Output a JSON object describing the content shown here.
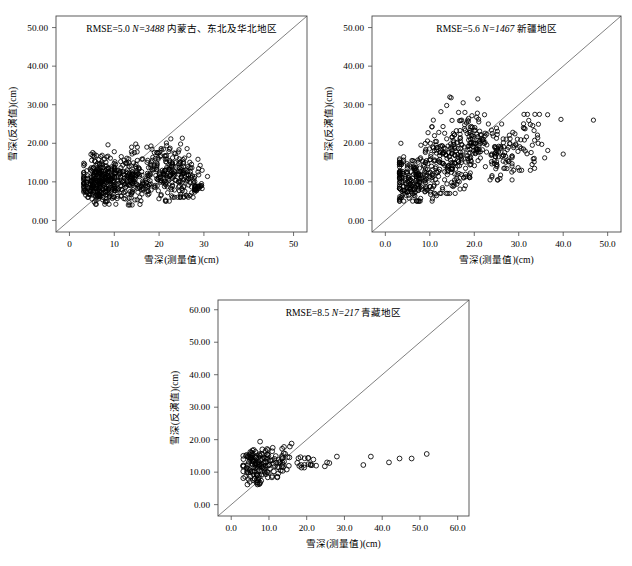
{
  "figure": {
    "type": "scatter-figure",
    "panel_count": 3,
    "background_color": "#ffffff",
    "marker_color": "#000000",
    "line_color": "#555555"
  },
  "chart_data": [
    {
      "type": "scatter",
      "panel_id": "panel-northeast",
      "title": "RMSE=5.0  N=3488  内蒙古、东北及华北地区",
      "rmse_label": "RMSE=5.0",
      "rmse": 5.0,
      "n_label": "N=3488",
      "n": 3488,
      "region": "内蒙古、东北及华北地区",
      "xlabel": "雪深(测量值)(cm)",
      "ylabel": "雪深(反演值)(cm)",
      "xlim": [
        -3,
        53
      ],
      "ylim": [
        -3,
        53
      ],
      "xticks": [
        0,
        10,
        20,
        30,
        40,
        50
      ],
      "xtick_labels": [
        "0",
        "10",
        "20",
        "30",
        "40",
        "50"
      ],
      "yticks": [
        0,
        10,
        20,
        30,
        40,
        50
      ],
      "ytick_labels": [
        "0.00",
        "10.00",
        "20.00",
        "30.00",
        "40.00",
        "50.00"
      ],
      "grid": false,
      "legend": "none",
      "reference_line": {
        "label": "1:1 line",
        "from": [
          -3,
          -3
        ],
        "to": [
          53,
          53
        ]
      },
      "annotations": [],
      "n_drawn": 760,
      "seed": 1471,
      "clusters": [
        {
          "weight": 0.44,
          "x_mean": 7.0,
          "x_sd": 2.4,
          "y_mean": 10.0,
          "y_sd": 2.9,
          "x_min": 3.2,
          "x_max": 13.5,
          "y_min": 4.2,
          "y_max": 18.5
        },
        {
          "weight": 0.22,
          "x_mean": 14.0,
          "x_sd": 2.6,
          "y_mean": 10.8,
          "y_sd": 3.2,
          "x_min": 10.0,
          "x_max": 19.5,
          "y_min": 4.0,
          "y_max": 19.0
        },
        {
          "weight": 0.2,
          "x_mean": 21.5,
          "x_sd": 2.0,
          "y_mean": 13.0,
          "y_sd": 4.0,
          "x_min": 17.5,
          "x_max": 25.5,
          "y_min": 5.0,
          "y_max": 21.8
        },
        {
          "weight": 0.11,
          "x_mean": 26.0,
          "x_sd": 1.6,
          "y_mean": 12.0,
          "y_sd": 3.4,
          "x_min": 23.0,
          "x_max": 29.5,
          "y_min": 6.0,
          "y_max": 19.0
        },
        {
          "weight": 0.03,
          "x_mean": 28.3,
          "x_sd": 0.7,
          "y_mean": 8.6,
          "y_sd": 0.9,
          "x_min": 27.2,
          "x_max": 29.6,
          "y_min": 7.2,
          "y_max": 10.2
        }
      ],
      "outliers": [
        [
          30.8,
          11.4
        ],
        [
          24.8,
          19.8
        ],
        [
          14.8,
          19.8
        ],
        [
          8.6,
          19.6
        ],
        [
          5.2,
          17.6
        ],
        [
          18.2,
          19.3
        ],
        [
          29.6,
          13.0
        ]
      ]
    },
    {
      "type": "scatter",
      "panel_id": "panel-xinjiang",
      "title": "RMSE=5.6  N=1467  新疆地区",
      "rmse_label": "RMSE=5.6",
      "rmse": 5.6,
      "n_label": "N=1467",
      "n": 1467,
      "region": "新疆地区",
      "xlabel": "雪深(测量值)(cm)",
      "ylabel": "雪深(反演值)(cm)",
      "xlim": [
        -3,
        53
      ],
      "ylim": [
        -3,
        53
      ],
      "xticks": [
        0,
        10,
        20,
        30,
        40,
        50
      ],
      "xtick_labels": [
        "0.0",
        "10.0",
        "20.0",
        "30.0",
        "40.0",
        "50.0"
      ],
      "yticks": [
        0,
        10,
        20,
        30,
        40,
        50
      ],
      "ytick_labels": [
        "0.00",
        "10.00",
        "20.00",
        "30.00",
        "40.00",
        "50.00"
      ],
      "grid": false,
      "legend": "none",
      "reference_line": {
        "label": "1:1 line",
        "from": [
          -3,
          -3
        ],
        "to": [
          53,
          53
        ]
      },
      "annotations": [],
      "n_drawn": 620,
      "seed": 9283,
      "clusters": [
        {
          "weight": 0.34,
          "x_mean": 6.2,
          "x_sd": 2.2,
          "y_mean": 10.5,
          "y_sd": 3.0,
          "x_min": 3.2,
          "x_max": 11.5,
          "y_min": 5.0,
          "y_max": 16.5
        },
        {
          "weight": 0.26,
          "x_mean": 13.5,
          "x_sd": 2.8,
          "y_mean": 15.5,
          "y_sd": 4.2,
          "x_min": 9.0,
          "x_max": 19.0,
          "y_min": 7.0,
          "y_max": 26.0
        },
        {
          "weight": 0.22,
          "x_mean": 19.5,
          "x_sd": 2.6,
          "y_mean": 19.5,
          "y_sd": 4.5,
          "x_min": 15.0,
          "x_max": 25.0,
          "y_min": 9.0,
          "y_max": 28.0
        },
        {
          "weight": 0.1,
          "x_mean": 25.5,
          "x_sd": 1.8,
          "y_mean": 16.5,
          "y_sd": 4.0,
          "x_min": 22.5,
          "x_max": 28.5,
          "y_min": 10.5,
          "y_max": 25.0
        },
        {
          "weight": 0.08,
          "x_mean": 32.0,
          "x_sd": 2.4,
          "y_mean": 20.5,
          "y_sd": 4.2,
          "x_min": 28.0,
          "x_max": 37.0,
          "y_min": 13.0,
          "y_max": 27.5
        }
      ],
      "outliers": [
        [
          46.8,
          26.0
        ],
        [
          39.5,
          26.2
        ],
        [
          36.5,
          27.4
        ],
        [
          14.5,
          32.0
        ],
        [
          14.8,
          31.8
        ],
        [
          17.5,
          30.5
        ],
        [
          20.8,
          31.5
        ],
        [
          13.8,
          29.8
        ],
        [
          12.5,
          28.2
        ],
        [
          3.5,
          20.0
        ],
        [
          8.0,
          19.5
        ],
        [
          10.6,
          5.6
        ],
        [
          18.0,
          9.0
        ],
        [
          40.0,
          17.2
        ],
        [
          33.0,
          14.5
        ]
      ]
    },
    {
      "type": "scatter",
      "panel_id": "panel-tibet",
      "title": "RMSE=8.5  N=217  青藏地区",
      "rmse_label": "RMSE=8.5",
      "rmse": 8.5,
      "n_label": "N=217",
      "n": 217,
      "region": "青藏地区",
      "xlabel": "雪深(测量值)(cm)",
      "ylabel": "雪深(反演值)(cm)",
      "xlim": [
        -3.5,
        63
      ],
      "ylim": [
        -3.5,
        63
      ],
      "xticks": [
        0,
        10,
        20,
        30,
        40,
        50,
        60
      ],
      "xtick_labels": [
        "0.0",
        "10.0",
        "20.0",
        "30.0",
        "40.0",
        "50.0",
        "60.0"
      ],
      "yticks": [
        0,
        10,
        20,
        30,
        40,
        50,
        60
      ],
      "ytick_labels": [
        "0.00",
        "10.00",
        "20.00",
        "30.00",
        "40.00",
        "50.00",
        "60.00"
      ],
      "grid": false,
      "legend": "none",
      "reference_line": {
        "label": "1:1 line",
        "from": [
          -3.5,
          -3.5
        ],
        "to": [
          63,
          63
        ]
      },
      "annotations": [],
      "n_drawn": 190,
      "seed": 3317,
      "clusters": [
        {
          "weight": 0.62,
          "x_mean": 5.8,
          "x_sd": 2.1,
          "y_mean": 12.4,
          "y_sd": 2.6,
          "x_min": 3.2,
          "x_max": 10.5,
          "y_min": 6.2,
          "y_max": 19.4
        },
        {
          "weight": 0.24,
          "x_mean": 12.5,
          "x_sd": 2.2,
          "y_mean": 13.4,
          "y_sd": 2.3,
          "x_min": 9.5,
          "x_max": 17.0,
          "y_min": 8.4,
          "y_max": 18.8
        },
        {
          "weight": 0.08,
          "x_mean": 19.5,
          "x_sd": 1.6,
          "y_mean": 12.8,
          "y_sd": 1.2,
          "x_min": 17.5,
          "x_max": 22.0,
          "y_min": 11.4,
          "y_max": 14.6
        }
      ],
      "outliers": [
        [
          51.8,
          15.6
        ],
        [
          47.8,
          14.2
        ],
        [
          44.6,
          14.2
        ],
        [
          41.8,
          13.0
        ],
        [
          37.0,
          14.8
        ],
        [
          35.0,
          12.2
        ],
        [
          28.0,
          14.8
        ],
        [
          26.0,
          12.8
        ],
        [
          24.8,
          11.8
        ],
        [
          25.4,
          13.0
        ],
        [
          22.5,
          12.0
        ],
        [
          21.0,
          12.4
        ],
        [
          16.0,
          18.8
        ],
        [
          13.5,
          17.2
        ],
        [
          11.0,
          17.5
        ],
        [
          10.8,
          8.4
        ],
        [
          12.2,
          8.6
        ]
      ]
    }
  ]
}
